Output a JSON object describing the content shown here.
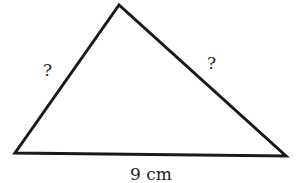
{
  "diagram": {
    "type": "triangle",
    "vertices": {
      "top": [
        119,
        5
      ],
      "bottom_left": [
        15,
        153
      ],
      "bottom_right": [
        286,
        156
      ]
    },
    "stroke_color": "#1a1a1a",
    "labels": {
      "left_side": "?",
      "right_side": "?",
      "base": "9 cm"
    }
  }
}
